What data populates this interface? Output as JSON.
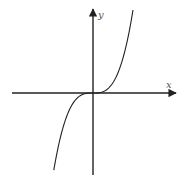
{
  "chart_data": {
    "type": "line",
    "title": "",
    "xlabel": "x",
    "ylabel": "y",
    "function": "y = x^3",
    "grid": false,
    "legend": null,
    "x_ticks": [],
    "y_ticks": [],
    "x": [
      -1.0,
      -0.75,
      -0.5,
      -0.25,
      0,
      0.25,
      0.5,
      0.75,
      1.0
    ],
    "y": [
      -1.0,
      -0.421875,
      -0.125,
      -0.015625,
      0,
      0.015625,
      0.125,
      0.421875,
      1.0
    ],
    "xlim": [
      -2.0,
      2.0
    ],
    "ylim": [
      -1.0,
      1.0
    ],
    "colors": {
      "axis": "#222222",
      "curve": "#222222",
      "label": "#555555"
    }
  },
  "labels": {
    "x_axis": "x",
    "y_axis": "y"
  }
}
